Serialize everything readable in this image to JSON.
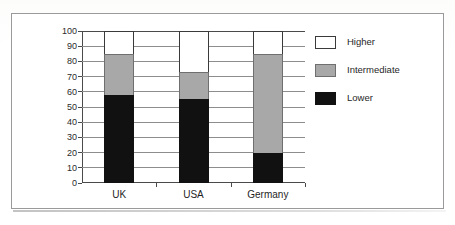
{
  "chart_data": {
    "type": "bar",
    "subtype": "stacked-column",
    "title": "",
    "xlabel": "",
    "ylabel": "",
    "categories": [
      "UK",
      "USA",
      "Germany"
    ],
    "series": [
      {
        "name": "Lower",
        "color": "#111111",
        "values": [
          58,
          55,
          20
        ]
      },
      {
        "name": "Intermediate",
        "color": "#a8a8a8",
        "values": [
          27,
          18,
          65
        ]
      },
      {
        "name": "Higher",
        "color": "#ffffff",
        "values": [
          15,
          27,
          15
        ]
      }
    ],
    "cumulative_tops": {
      "UK": {
        "lower": 58,
        "intermediate": 85,
        "higher": 100
      },
      "USA": {
        "lower": 55,
        "intermediate": 73,
        "higher": 100
      },
      "Germany": {
        "lower": 20,
        "intermediate": 85,
        "higher": 100
      }
    },
    "ylim": [
      0,
      100
    ],
    "ytick_step": 10,
    "ytick_labels": [
      "0",
      "10",
      "20",
      "30",
      "40",
      "50",
      "60",
      "70",
      "80",
      "90",
      "100"
    ],
    "grid": "horizontal",
    "legend_position": "right",
    "stack_order_bottom_to_top": [
      "Lower",
      "Intermediate",
      "Higher"
    ]
  },
  "legend": {
    "items": [
      {
        "label": "Higher",
        "swatch": "higher"
      },
      {
        "label": "Intermediate",
        "swatch": "intermediate"
      },
      {
        "label": "Lower",
        "swatch": "lower"
      }
    ]
  },
  "axis": {
    "y_labels": [
      "100",
      "90",
      "80",
      "70",
      "60",
      "50",
      "40",
      "30",
      "20",
      "10",
      "0"
    ],
    "x_labels": [
      "UK",
      "USA",
      "Germany"
    ]
  }
}
